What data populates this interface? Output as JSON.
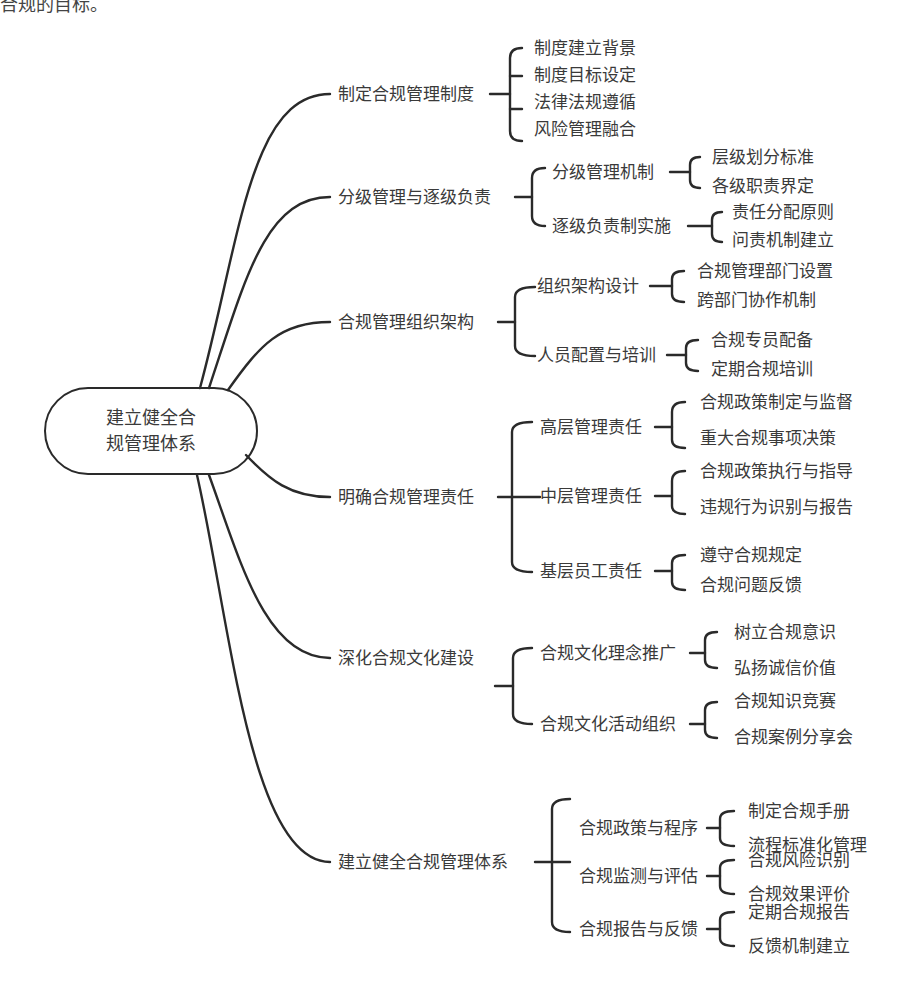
{
  "header_fragment": "合规的目标。",
  "root": {
    "line1": "建立健全合",
    "line2": "规管理体系"
  },
  "branches": [
    {
      "label": "制定合规管理制度",
      "children": [
        {
          "label": "制度建立背景"
        },
        {
          "label": "制度目标设定"
        },
        {
          "label": "法律法规遵循"
        },
        {
          "label": "风险管理融合"
        }
      ]
    },
    {
      "label": "分级管理与逐级负责",
      "children": [
        {
          "label": "分级管理机制",
          "children": [
            "层级划分标准",
            "各级职责界定"
          ]
        },
        {
          "label": "逐级负责制实施",
          "children": [
            "责任分配原则",
            "问责机制建立"
          ]
        }
      ]
    },
    {
      "label": "合规管理组织架构",
      "children": [
        {
          "label": "组织架构设计",
          "children": [
            "合规管理部门设置",
            "跨部门协作机制"
          ]
        },
        {
          "label": "人员配置与培训",
          "children": [
            "合规专员配备",
            "定期合规培训"
          ]
        }
      ]
    },
    {
      "label": "明确合规管理责任",
      "children": [
        {
          "label": "高层管理责任",
          "children": [
            "合规政策制定与监督",
            "重大合规事项决策"
          ]
        },
        {
          "label": "中层管理责任",
          "children": [
            "合规政策执行与指导",
            "违规行为识别与报告"
          ]
        },
        {
          "label": "基层员工责任",
          "children": [
            "遵守合规规定",
            "合规问题反馈"
          ]
        }
      ]
    },
    {
      "label": "深化合规文化建设",
      "children": [
        {
          "label": "合规文化理念推广",
          "children": [
            "树立合规意识",
            "弘扬诚信价值"
          ]
        },
        {
          "label": "合规文化活动组织",
          "children": [
            "合规知识竞赛",
            "合规案例分享会"
          ]
        }
      ]
    },
    {
      "label": "建立健全合规管理体系",
      "children": [
        {
          "label": "合规政策与程序",
          "children": [
            "制定合规手册",
            "流程标准化管理"
          ]
        },
        {
          "label": "合规监测与评估",
          "children": [
            "合规风险识别",
            "合规效果评价"
          ]
        },
        {
          "label": "合规报告与反馈",
          "children": [
            "定期合规报告",
            "反馈机制建立"
          ]
        }
      ]
    }
  ],
  "colors": {
    "line": "#2a2a2a",
    "text": "#3a3a3a",
    "background": "#ffffff"
  }
}
